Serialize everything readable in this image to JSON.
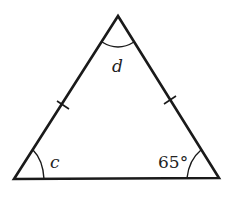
{
  "diagram": {
    "type": "isosceles-triangle",
    "vertices": {
      "apex": {
        "x": 118,
        "y": 16
      },
      "bottom_left": {
        "x": 14,
        "y": 179
      },
      "bottom_right": {
        "x": 219,
        "y": 178
      }
    },
    "labels": {
      "apex_angle": "d",
      "left_angle": "c",
      "right_angle": "65°"
    },
    "equal_side_marks": [
      "left-side",
      "right-side"
    ],
    "stroke_color": "#1a1a1a",
    "background": "#ffffff"
  }
}
